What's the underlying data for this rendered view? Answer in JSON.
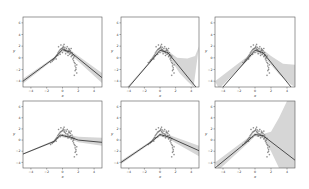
{
  "figure": {
    "layout": "2x3 grid",
    "colors": {
      "fit_line": "#3a3a3a",
      "band": "#cfcfcf",
      "points": "#555555",
      "frame": "#555555"
    }
  },
  "chart_data": [
    {
      "type": "scatter",
      "panel": "row1-col1",
      "xlabel": "x",
      "ylabel": "y",
      "xlim": [
        -5,
        5
      ],
      "ylim": [
        -5,
        7
      ],
      "xticks": [
        -4,
        -2,
        0,
        2,
        4
      ],
      "yticks": [
        -4,
        -2,
        0,
        2,
        4,
        6
      ],
      "fit": {
        "x": [
          -5,
          -1,
          0,
          1,
          5
        ],
        "y": [
          -4,
          0,
          1.4,
          1,
          -3.4
        ]
      },
      "band_upper": {
        "x": [
          -5,
          -1,
          0,
          1,
          5
        ],
        "y": [
          -3.6,
          0.2,
          1.7,
          1.3,
          -2.6
        ]
      },
      "band_lower": {
        "x": [
          -5,
          -1,
          0,
          1,
          5
        ],
        "y": [
          -4.4,
          -0.2,
          1.1,
          0.6,
          -4.3
        ]
      }
    },
    {
      "type": "scatter",
      "panel": "row1-col2",
      "xlabel": "x",
      "ylabel": "y",
      "xlim": [
        -5,
        5
      ],
      "ylim": [
        -5,
        7
      ],
      "xticks": [
        -4,
        -2,
        0,
        2,
        4
      ],
      "yticks": [
        -4,
        -2,
        0,
        2,
        4,
        6
      ],
      "fit": {
        "x": [
          -4,
          -1,
          0,
          1,
          4.6
        ],
        "y": [
          -5,
          -0.3,
          1.3,
          0.9,
          -5
        ]
      },
      "band_upper": {
        "x": [
          -4.2,
          -1,
          0,
          1,
          2.2,
          3.5,
          4.5,
          5
        ],
        "y": [
          -5,
          -0.1,
          1.6,
          1.2,
          0,
          -0.1,
          0.3,
          2
        ]
      },
      "band_lower": {
        "x": [
          -4,
          -1,
          0,
          1,
          2.5,
          3.5,
          4.3
        ],
        "y": [
          -5,
          -0.5,
          1.0,
          0.5,
          -2.6,
          -4,
          -5
        ]
      }
    },
    {
      "type": "scatter",
      "panel": "row1-col3",
      "xlabel": "x",
      "ylabel": "y",
      "xlim": [
        -5,
        5
      ],
      "ylim": [
        -5,
        7
      ],
      "xticks": [
        -4,
        -2,
        0,
        2,
        4
      ],
      "yticks": [
        -4,
        -2,
        0,
        2,
        4,
        6
      ],
      "fit": {
        "x": [
          -4,
          -1,
          0,
          1,
          4.5
        ],
        "y": [
          -5,
          -0.3,
          1.3,
          0.9,
          -5
        ]
      },
      "band_upper": {
        "x": [
          -5,
          -1,
          0,
          1,
          2,
          3.5,
          5
        ],
        "y": [
          -4,
          0.2,
          1.7,
          1.4,
          0.3,
          -1,
          -1.2
        ]
      },
      "band_lower": {
        "x": [
          -4.5,
          -1,
          0,
          1,
          3,
          4.5,
          5
        ],
        "y": [
          -5.3,
          -0.6,
          0.9,
          0.4,
          -2.8,
          -4.6,
          -5
        ]
      }
    },
    {
      "type": "scatter",
      "panel": "row2-col1",
      "xlabel": "x",
      "ylabel": "y",
      "xlim": [
        -5,
        5
      ],
      "ylim": [
        -5,
        7
      ],
      "xticks": [
        -4,
        -2,
        0,
        2,
        4
      ],
      "yticks": [
        -4,
        -2,
        0,
        2,
        4,
        6
      ],
      "fit": {
        "x": [
          -5,
          -1,
          -0.3,
          1,
          2,
          5
        ],
        "y": [
          -2.5,
          -0.2,
          0.9,
          0.5,
          0,
          -0.4
        ]
      },
      "band_upper": {
        "x": [
          -5,
          -1,
          -0.3,
          1,
          2,
          5
        ],
        "y": [
          -2.4,
          0,
          1.2,
          0.9,
          0.6,
          0.4
        ]
      },
      "band_lower": {
        "x": [
          -5,
          -1,
          -0.3,
          1,
          2,
          5
        ],
        "y": [
          -2.6,
          -0.4,
          0.6,
          0.2,
          -0.4,
          -1
        ]
      }
    },
    {
      "type": "scatter",
      "panel": "row2-col2",
      "xlabel": "x",
      "ylabel": "y",
      "xlim": [
        -5,
        5
      ],
      "ylim": [
        -5,
        7
      ],
      "xticks": [
        -4,
        -2,
        0,
        2,
        4
      ],
      "yticks": [
        -4,
        -2,
        0,
        2,
        4,
        6
      ],
      "fit": {
        "x": [
          -5,
          -1,
          0,
          1,
          5
        ],
        "y": [
          -4,
          -0.2,
          1,
          0.6,
          -1.9
        ]
      },
      "band_upper": {
        "x": [
          -5,
          -1,
          0,
          1,
          5
        ],
        "y": [
          -3.7,
          0,
          1.3,
          1.0,
          -1
        ]
      },
      "band_lower": {
        "x": [
          -5,
          -1,
          0,
          1,
          5
        ],
        "y": [
          -4.3,
          -0.4,
          0.7,
          0.3,
          -2.9
        ]
      }
    },
    {
      "type": "scatter",
      "panel": "row2-col3",
      "xlabel": "x",
      "ylabel": "y",
      "xlim": [
        -5,
        5
      ],
      "ylim": [
        -5,
        7
      ],
      "xticks": [
        -4,
        -2,
        0,
        2,
        4
      ],
      "yticks": [
        -4,
        -2,
        0,
        2,
        4,
        6
      ],
      "fit": {
        "x": [
          -5,
          -1,
          0,
          1,
          5
        ],
        "y": [
          -5,
          -0.3,
          1,
          0.8,
          -3.6
        ]
      },
      "band_upper": {
        "x": [
          -5,
          -1,
          0,
          1,
          2,
          3,
          4,
          5
        ],
        "y": [
          -4,
          0.3,
          1.3,
          1.1,
          1.5,
          4,
          7,
          7
        ]
      },
      "band_lower": {
        "x": [
          -4.5,
          -1,
          0,
          1,
          2,
          3,
          4,
          5
        ],
        "y": [
          -5.3,
          -0.7,
          0.7,
          0.4,
          -2,
          -5,
          -5,
          -5
        ]
      }
    }
  ],
  "scatter_points": {
    "note": "shared noisy data cluster, x roughly -1.5 to 2, y roughly -3 to 2.4",
    "x": [
      -1.5,
      -1.3,
      -1.2,
      -1.1,
      -1.0,
      -0.9,
      -0.8,
      -0.7,
      -0.6,
      -0.5,
      -0.4,
      -0.3,
      -0.2,
      -0.1,
      0.0,
      0.1,
      0.2,
      0.3,
      0.4,
      0.5,
      0.6,
      0.7,
      0.8,
      0.9,
      1.0,
      1.1,
      1.2,
      1.3,
      1.4,
      1.5,
      1.6,
      1.7,
      1.8,
      -0.5,
      -0.2,
      0.1,
      0.3,
      0.6,
      0.8,
      1.0,
      1.2,
      1.4,
      1.6,
      1.7,
      -0.3,
      0.0,
      0.4,
      0.7,
      1.1,
      1.5,
      -0.8,
      -0.6,
      0.2,
      0.9,
      1.3,
      1.6,
      1.8,
      1.5
    ],
    "y": [
      -0.8,
      -0.6,
      -0.4,
      -0.3,
      -0.1,
      0.1,
      0.3,
      0.5,
      0.8,
      1.0,
      1.2,
      1.4,
      1.5,
      1.6,
      1.7,
      1.8,
      1.5,
      1.4,
      1.2,
      1.6,
      1.1,
      0.9,
      1.3,
      0.6,
      0.8,
      0.2,
      0.4,
      -0.2,
      0.0,
      -0.8,
      -1.4,
      -2.0,
      -2.6,
      1.9,
      2.2,
      2.0,
      1.8,
      1.9,
      1.6,
      1.2,
      0.9,
      -0.5,
      -1.0,
      -1.7,
      0.6,
      0.9,
      0.7,
      0.4,
      1.6,
      0.3,
      -0.2,
      0.4,
      2.3,
      1.4,
      0.5,
      -2.2,
      -1.2,
      -3.0
    ]
  }
}
